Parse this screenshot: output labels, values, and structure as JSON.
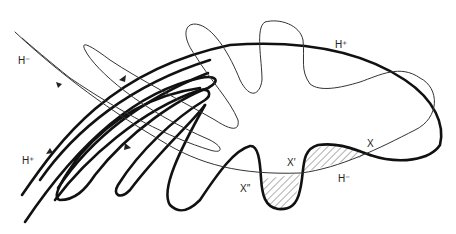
{
  "figure": {
    "type": "homoclinic tangle",
    "labels": {
      "h_minus_top_left": "H⁻",
      "h_plus_bottom_left": "H⁺",
      "h_plus_top_right": "H⁺",
      "h_minus_bottom_right": "H⁻",
      "x": "X",
      "x_prime": "X′",
      "x_double_prime": "X″"
    },
    "curves": [
      {
        "name": "stable-manifold-H-plus",
        "style": "thick"
      },
      {
        "name": "unstable-manifold-H-minus",
        "style": "thin"
      }
    ],
    "hatched_lobes": [
      "lobe-X-X-prime",
      "lobe-X-prime-X-double-prime"
    ],
    "colors": {
      "ink": "#111111",
      "background": "#ffffff"
    }
  }
}
